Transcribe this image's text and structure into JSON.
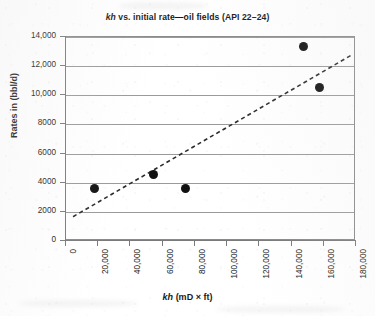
{
  "chart_data": {
    "type": "scatter",
    "title": "kh vs. initial rate—oil fields (API 22–24)",
    "title_parts": {
      "italic": "kh",
      "rest": " vs. initial rate—oil fields (API 22–24)"
    },
    "xlabel": "kh (mD × ft)",
    "xlabel_parts": {
      "italic": "kh",
      "rest": " (mD × ft)"
    },
    "ylabel": "Rates in (bbl/d)",
    "xlim": [
      0,
      180000
    ],
    "ylim": [
      0,
      14000
    ],
    "xticks": [
      0,
      20000,
      40000,
      60000,
      80000,
      100000,
      120000,
      140000,
      160000,
      180000
    ],
    "xtick_labels": [
      "0",
      "20,000",
      "40,000",
      "60,000",
      "80,000",
      "100,000",
      "120,000",
      "140,000",
      "160,000",
      "180,000"
    ],
    "yticks": [
      0,
      2000,
      4000,
      6000,
      8000,
      10000,
      12000,
      14000
    ],
    "ytick_labels": [
      "0",
      "2000",
      "4000",
      "6000",
      "8000",
      "10,000",
      "12,000",
      "14,000"
    ],
    "grid": "horizontal",
    "legend": "none",
    "marker": "filled-circle",
    "marker_color": "#111111",
    "gridline_color": "#9a9a9a",
    "frame_color": "#8a8a8a",
    "series": [
      {
        "name": "oil fields (API 22-24)",
        "points": [
          {
            "x": 18000,
            "y": 3550
          },
          {
            "x": 55000,
            "y": 4500
          },
          {
            "x": 75000,
            "y": 3550
          },
          {
            "x": 148000,
            "y": 13300
          },
          {
            "x": 158000,
            "y": 10500
          }
        ]
      }
    ],
    "trendline": {
      "style": "dashed",
      "color": "#2b2b2b",
      "x_start": 5000,
      "y_start": 1600,
      "x_end": 178000,
      "y_end": 12700
    }
  }
}
